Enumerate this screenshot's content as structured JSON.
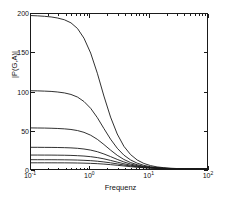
{
  "chart_data": {
    "type": "line",
    "title": "",
    "xlabel": "Frequenz",
    "ylabel": "|P(G,A)|",
    "xscale": "log",
    "yscale": "linear",
    "xlim": [
      0.1,
      100
    ],
    "ylim": [
      0,
      200
    ],
    "grid": false,
    "legend": false,
    "xticks": [
      0.1,
      1,
      10,
      100
    ],
    "xticklabels": [
      "10-1",
      "100",
      "101",
      "102"
    ],
    "xtick_bases": [
      "10",
      "10",
      "10",
      "10"
    ],
    "xtick_exponents": [
      "-1",
      "0",
      "1",
      "2"
    ],
    "yticks": [
      0,
      50,
      100,
      150,
      200
    ],
    "yticklabels": [
      "0",
      "50",
      "100",
      "150",
      "200"
    ],
    "series": [
      {
        "name": "curve-1",
        "dc_gain": 198,
        "corner_freq": 0.85,
        "x": [
          0.1,
          0.13,
          0.17,
          0.22,
          0.28,
          0.37,
          0.48,
          0.62,
          0.8,
          1.04,
          1.35,
          1.75,
          2.27,
          2.95,
          3.83,
          4.98,
          6.46,
          8.38,
          10.9,
          14.1,
          18.3,
          23.8,
          30.9,
          40.1,
          52.0,
          67.5,
          87.6,
          100
        ],
        "y": [
          198,
          197.6,
          197,
          196.2,
          194.9,
          192.6,
          188.6,
          181.3,
          168.8,
          149.6,
          123.6,
          94.1,
          67.0,
          45.2,
          29.3,
          18.6,
          11.6,
          7.2,
          4.4,
          2.7,
          1.7,
          1.0,
          0.6,
          0.4,
          0.2,
          0.15,
          0.1,
          0.08
        ]
      },
      {
        "name": "curve-2",
        "dc_gain": 101,
        "corner_freq": 1.0,
        "x": [
          0.1,
          0.13,
          0.17,
          0.22,
          0.28,
          0.37,
          0.48,
          0.62,
          0.8,
          1.04,
          1.35,
          1.75,
          2.27,
          2.95,
          3.83,
          4.98,
          6.46,
          8.38,
          10.9,
          14.1,
          18.3,
          23.8,
          30.9,
          40.1,
          52.0,
          67.5,
          87.6,
          100
        ],
        "y": [
          101,
          100.8,
          100.5,
          100.1,
          99.4,
          98.2,
          96.2,
          92.8,
          87.1,
          78.3,
          66.3,
          52.2,
          38.5,
          26.8,
          17.9,
          11.7,
          7.5,
          4.7,
          2.9,
          1.8,
          1.1,
          0.7,
          0.4,
          0.25,
          0.16,
          0.1,
          0.07,
          0.05
        ]
      },
      {
        "name": "curve-3",
        "dc_gain": 53,
        "corner_freq": 1.2,
        "x": [
          0.1,
          0.13,
          0.17,
          0.22,
          0.28,
          0.37,
          0.48,
          0.62,
          0.8,
          1.04,
          1.35,
          1.75,
          2.27,
          2.95,
          3.83,
          4.98,
          6.46,
          8.38,
          10.9,
          14.1,
          18.3,
          23.8,
          30.9,
          40.1,
          52.0,
          67.5,
          87.6,
          100
        ],
        "y": [
          53,
          52.9,
          52.8,
          52.6,
          52.3,
          51.8,
          51.0,
          49.6,
          47.3,
          43.6,
          38.3,
          31.6,
          24.4,
          17.7,
          12.3,
          8.3,
          5.5,
          3.5,
          2.2,
          1.4,
          0.85,
          0.52,
          0.32,
          0.19,
          0.12,
          0.07,
          0.045,
          0.035
        ]
      },
      {
        "name": "curve-4",
        "dc_gain": 28,
        "corner_freq": 1.6,
        "x": [
          0.1,
          0.13,
          0.17,
          0.22,
          0.28,
          0.37,
          0.48,
          0.62,
          0.8,
          1.04,
          1.35,
          1.75,
          2.27,
          2.95,
          3.83,
          4.98,
          6.46,
          8.38,
          10.9,
          14.1,
          18.3,
          23.8,
          30.9,
          40.1,
          52.0,
          67.5,
          87.6,
          100
        ],
        "y": [
          28,
          27.97,
          27.9,
          27.85,
          27.75,
          27.55,
          27.25,
          26.7,
          25.8,
          24.4,
          22.3,
          19.4,
          16.0,
          12.4,
          9.1,
          6.4,
          4.4,
          2.9,
          1.9,
          1.2,
          0.75,
          0.47,
          0.29,
          0.18,
          0.11,
          0.07,
          0.04,
          0.03
        ]
      },
      {
        "name": "curve-5",
        "dc_gain": 18,
        "corner_freq": 2.0,
        "x": [
          0.1,
          0.13,
          0.17,
          0.22,
          0.28,
          0.37,
          0.48,
          0.62,
          0.8,
          1.04,
          1.35,
          1.75,
          2.27,
          2.95,
          3.83,
          4.98,
          6.46,
          8.38,
          10.9,
          14.1,
          18.3,
          23.8,
          30.9,
          40.1,
          52.0,
          67.5,
          87.6,
          100
        ],
        "y": [
          18,
          17.99,
          17.96,
          17.92,
          17.86,
          17.75,
          17.55,
          17.2,
          16.7,
          15.9,
          14.7,
          13.1,
          11.1,
          8.9,
          6.8,
          4.9,
          3.5,
          2.4,
          1.6,
          1.05,
          0.67,
          0.42,
          0.26,
          0.16,
          0.1,
          0.06,
          0.04,
          0.03
        ]
      },
      {
        "name": "curve-6",
        "dc_gain": 12,
        "corner_freq": 2.4,
        "x": [
          0.1,
          0.13,
          0.17,
          0.22,
          0.28,
          0.37,
          0.48,
          0.62,
          0.8,
          1.04,
          1.35,
          1.75,
          2.27,
          2.95,
          3.83,
          4.98,
          6.46,
          8.38,
          10.9,
          14.1,
          18.3,
          23.8,
          30.9,
          40.1,
          52.0,
          67.5,
          87.6,
          100
        ],
        "y": [
          12,
          11.99,
          11.98,
          11.96,
          11.92,
          11.85,
          11.73,
          11.52,
          11.2,
          10.75,
          10.05,
          9.1,
          7.95,
          6.6,
          5.2,
          3.9,
          2.8,
          2.0,
          1.35,
          0.9,
          0.58,
          0.37,
          0.23,
          0.14,
          0.09,
          0.055,
          0.035,
          0.028
        ]
      },
      {
        "name": "curve-7",
        "dc_gain": 8,
        "corner_freq": 2.8,
        "x": [
          0.1,
          0.13,
          0.17,
          0.22,
          0.28,
          0.37,
          0.48,
          0.62,
          0.8,
          1.04,
          1.35,
          1.75,
          2.27,
          2.95,
          3.83,
          4.98,
          6.46,
          8.38,
          10.9,
          14.1,
          18.3,
          23.8,
          30.9,
          40.1,
          52.0,
          67.5,
          87.6,
          100
        ],
        "y": [
          8,
          7.995,
          7.99,
          7.98,
          7.96,
          7.92,
          7.85,
          7.73,
          7.55,
          7.28,
          6.88,
          6.32,
          5.62,
          4.8,
          3.9,
          3.0,
          2.2,
          1.6,
          1.1,
          0.74,
          0.48,
          0.31,
          0.19,
          0.12,
          0.075,
          0.047,
          0.03,
          0.024
        ]
      }
    ],
    "line_color": "#1a1a1a",
    "axis_color": "#1a1a1a",
    "background_color": "#ffffff"
  }
}
